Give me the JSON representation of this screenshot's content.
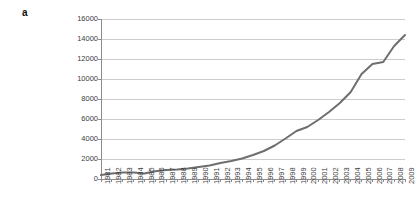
{
  "figure": {
    "panel_label": "a",
    "background_color": "#ffffff"
  },
  "chart_data": {
    "type": "line",
    "title": "",
    "subtitle": "",
    "xlabel": "",
    "ylabel": "",
    "legend": [],
    "legend_position": "none",
    "grid": "horizontal",
    "grid_color": "#b8b8b8",
    "axis_color": "#8c8c8c",
    "line_color": "#6e6e6e",
    "line_width": 2,
    "marker": "none",
    "xlim": [
      "1981",
      "2009"
    ],
    "ylim": [
      0,
      16000
    ],
    "ytick_step": 2000,
    "ytick_labels": [
      "0",
      "2000",
      "4000",
      "6000",
      "8000",
      "10000",
      "12000",
      "14000",
      "16000"
    ],
    "ytick_values": [
      0,
      2000,
      4000,
      6000,
      8000,
      10000,
      12000,
      14000,
      16000
    ],
    "categories": [
      "1981",
      "1982",
      "1983",
      "1984",
      "1985",
      "1986",
      "1987",
      "1988",
      "1989",
      "1990",
      "1991",
      "1992",
      "1993",
      "1994",
      "1995",
      "1996",
      "1997",
      "1998",
      "1999",
      "2000",
      "2001",
      "2002",
      "2003",
      "2004",
      "2005",
      "2006",
      "2007",
      "2008",
      "2009"
    ],
    "x": [
      1981,
      1982,
      1983,
      1984,
      1985,
      1986,
      1987,
      1988,
      1989,
      1990,
      1991,
      1992,
      1993,
      1994,
      1995,
      1996,
      1997,
      1998,
      1999,
      2000,
      2001,
      2002,
      2003,
      2004,
      2005,
      2006,
      2007,
      2008,
      2009
    ],
    "values": [
      400,
      560,
      650,
      640,
      560,
      780,
      900,
      950,
      1050,
      1200,
      1350,
      1600,
      1800,
      2050,
      2400,
      2800,
      3350,
      4050,
      4800,
      5200,
      5900,
      6700,
      7600,
      8700,
      10500,
      11500,
      11700,
      13300,
      14400
    ],
    "series": [
      {
        "name": "count",
        "values": [
          400,
          560,
          650,
          640,
          560,
          780,
          900,
          950,
          1050,
          1200,
          1350,
          1600,
          1800,
          2050,
          2400,
          2800,
          3350,
          4050,
          4800,
          5200,
          5900,
          6700,
          7600,
          8700,
          10500,
          11500,
          11700,
          13300,
          14400
        ]
      }
    ]
  }
}
